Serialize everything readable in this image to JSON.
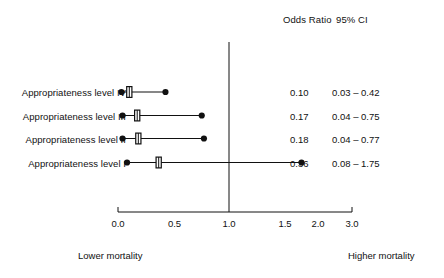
{
  "headers": {
    "odds_ratio": "Odds Ratio",
    "ci": "95% CI"
  },
  "footer": {
    "left": "Lower mortality",
    "right": "Higher mortality"
  },
  "chart_data": {
    "type": "scatter",
    "subtype": "forest-plot",
    "title": "",
    "xlabel": "",
    "ylabel": "",
    "grid": false,
    "legend": "none",
    "null_line": 1.0,
    "xticks": [
      "0.0",
      "0.5",
      "1.0",
      "1.5",
      "2.0",
      "3.0"
    ],
    "xtick_values": [
      0.0,
      0.5,
      1.0,
      1.5,
      2.0,
      3.0
    ],
    "xlim": [
      0.0,
      3.0
    ],
    "axis_note": "tick labels evenly spaced; scale compressed between 2.0 and 3.0",
    "categories": [
      "Appropriateness level IV",
      "Appropriateness level III",
      "Appropriateness level II",
      "Appropriateness level I"
    ],
    "rows": [
      {
        "label": "Appropriateness level IV",
        "odds_ratio": 0.1,
        "odds_ratio_text": "0.10",
        "ci_low": 0.03,
        "ci_high": 0.42,
        "ci_text": "0.03 – 0.42"
      },
      {
        "label": "Appropriateness level III",
        "odds_ratio": 0.17,
        "odds_ratio_text": "0.17",
        "ci_low": 0.04,
        "ci_high": 0.75,
        "ci_text": "0.04 – 0.75"
      },
      {
        "label": "Appropriateness level II",
        "odds_ratio": 0.18,
        "odds_ratio_text": "0.18",
        "ci_low": 0.04,
        "ci_high": 0.77,
        "ci_text": "0.04 – 0.77"
      },
      {
        "label": "Appropriateness level I",
        "odds_ratio": 0.36,
        "odds_ratio_text": "0.36",
        "ci_low": 0.08,
        "ci_high": 1.75,
        "ci_text": "0.08 – 1.75"
      }
    ],
    "colors": {
      "line": "#111111",
      "marker": "#111111",
      "axis": "#111111",
      "background": "#ffffff"
    }
  }
}
